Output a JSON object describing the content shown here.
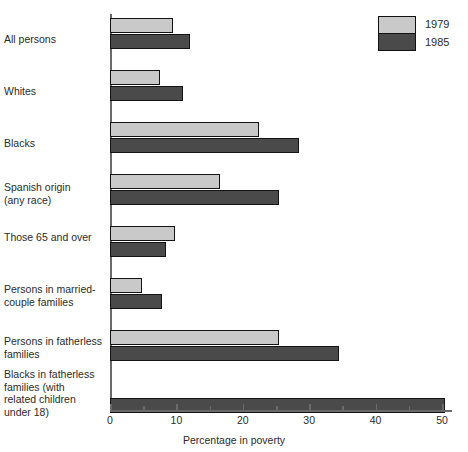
{
  "chart_data": {
    "type": "bar",
    "orientation": "horizontal",
    "title": "",
    "xlabel": "Percentage in poverty",
    "ylabel": "",
    "xlim": [
      0,
      52
    ],
    "grid": false,
    "legend_position": "top-right",
    "categories": [
      "All persons",
      "Whites",
      "Blacks",
      "Spanish origin\n(any race)",
      "Those 65 and over",
      "Persons in married-\ncouple families",
      "Persons in fatherless\nfamilies",
      "Blacks in fatherless\nfamilies (with\nrelated children\nunder 18)"
    ],
    "series": [
      {
        "name": "1979",
        "color": "#c9c9c9",
        "values": [
          9.5,
          7.5,
          22.5,
          16.5,
          9.8,
          4.8,
          25.5,
          0
        ]
      },
      {
        "name": "1985",
        "color": "#4a4a4a",
        "values": [
          12.0,
          11.0,
          28.5,
          25.5,
          8.4,
          7.8,
          34.5,
          50.5
        ]
      }
    ],
    "xticks_major": [
      0,
      10,
      20,
      30,
      40,
      50
    ],
    "xticks_minor": [
      5,
      15,
      25,
      35,
      45
    ],
    "xtick_labels": [
      "0",
      "10",
      "20",
      "30",
      "40",
      "50"
    ]
  },
  "legend": {
    "entries": [
      {
        "label": "1979",
        "color": "#c9c9c9"
      },
      {
        "label": "1985",
        "color": "#4a4a4a"
      }
    ]
  },
  "colors": {
    "series_1979": "#c9c9c9",
    "series_1985": "#4a4a4a",
    "outline": "#141414",
    "axis": "#6a6a6a",
    "text": "#2b2b2b",
    "background": "#ffffff"
  }
}
